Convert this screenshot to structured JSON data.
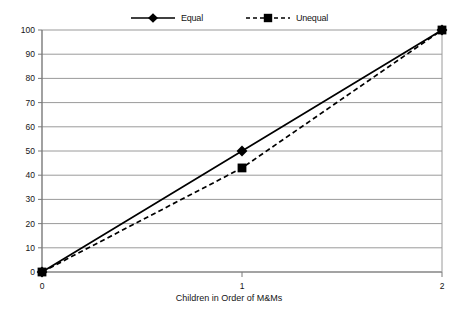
{
  "chart_data": {
    "type": "line",
    "title": "",
    "xlabel": "Children in Order of M&Ms",
    "ylabel": "",
    "x": [
      0,
      1,
      2
    ],
    "xticklabels": [
      "0",
      "1",
      "2"
    ],
    "yticklabels": [
      "0",
      "10",
      "20",
      "30",
      "40",
      "50",
      "60",
      "70",
      "80",
      "90",
      "100"
    ],
    "xlim": [
      0,
      2
    ],
    "ylim": [
      0,
      100
    ],
    "grid": "horizontal",
    "legend_position": "top-center",
    "series": [
      {
        "name": "Equal",
        "values": [
          0,
          50,
          100
        ],
        "line_style": "solid",
        "marker": "diamond",
        "color": "#000000"
      },
      {
        "name": "Unequal",
        "values": [
          0,
          43,
          100
        ],
        "line_style": "dashed",
        "marker": "square",
        "color": "#000000"
      }
    ]
  },
  "legend": {
    "entries": [
      {
        "label": "Equal",
        "marker_name": "diamond-marker"
      },
      {
        "label": "Unequal",
        "marker_name": "square-marker"
      }
    ]
  },
  "axes": {
    "y_labels": [
      "100",
      "90",
      "80",
      "70",
      "60",
      "50",
      "40",
      "30",
      "20",
      "10",
      "0"
    ],
    "x_labels": [
      "0",
      "1",
      "2"
    ],
    "x_title": "Children in Order of M&Ms"
  },
  "colors": {
    "gridline": "#9a9a9a",
    "axis": "#7a7a7a",
    "data": "#000000",
    "text": "#151515",
    "background": "#ffffff"
  }
}
